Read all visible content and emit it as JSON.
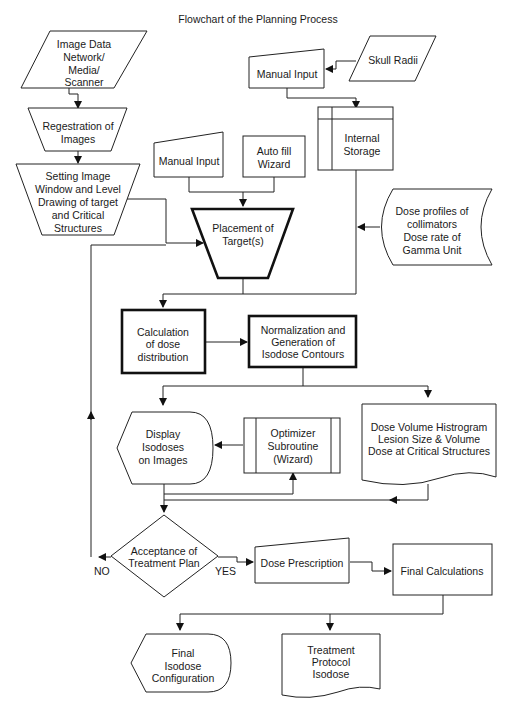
{
  "title": "Flowchart of the Planning Process",
  "nodes": {
    "image_data": {
      "shape": "parallelogram",
      "lines": [
        "Image Data",
        "Network/",
        "Media/",
        "Scanner"
      ]
    },
    "registration": {
      "shape": "trapezoid",
      "lines": [
        "Regestration of",
        "Images"
      ]
    },
    "setting_image": {
      "shape": "trapezoid",
      "lines": [
        "Setting Image",
        "Window and Level",
        "Drawing of target",
        "and Critical",
        "Structures"
      ]
    },
    "manual_input_top": {
      "shape": "manual-input",
      "lines": [
        "Manual Input"
      ]
    },
    "skull_radii": {
      "shape": "parallelogram",
      "lines": [
        "Skull Radii"
      ]
    },
    "internal_storage": {
      "shape": "internal-storage",
      "lines": [
        "Internal",
        "Storage"
      ]
    },
    "manual_input_mid": {
      "shape": "manual-input",
      "lines": [
        "Manual Input"
      ]
    },
    "auto_fill": {
      "shape": "process",
      "lines": [
        "Auto fill",
        "Wizard"
      ]
    },
    "placement": {
      "shape": "manual-operation",
      "lines": [
        "Placement of",
        "Target(s)"
      ]
    },
    "dose_profiles": {
      "shape": "stored-data",
      "lines": [
        "Dose profiles of",
        "collimators",
        "Dose rate of",
        "Gamma Unit"
      ]
    },
    "calculation": {
      "shape": "process-bold",
      "lines": [
        "Calculation",
        "of dose",
        "distribution"
      ]
    },
    "normalization": {
      "shape": "process-bold",
      "lines": [
        "Normalization and",
        "Generation of",
        "Isodose Contours"
      ]
    },
    "display_isodoses": {
      "shape": "display",
      "lines": [
        "Display",
        "Isodoses",
        "on Images"
      ]
    },
    "optimizer": {
      "shape": "predefined-process",
      "lines": [
        "Optimizer",
        "Subroutine",
        "(Wizard)"
      ]
    },
    "dvh": {
      "shape": "document",
      "lines": [
        "Dose Volume Histrogram",
        "Lesion Size & Volume",
        "Dose at Critical Structures"
      ]
    },
    "acceptance": {
      "shape": "decision",
      "lines": [
        "Acceptance of",
        "Treatment Plan"
      ]
    },
    "dose_prescription": {
      "shape": "manual-input",
      "lines": [
        "Dose Prescription"
      ]
    },
    "final_calculations": {
      "shape": "process",
      "lines": [
        "Final Calculations"
      ]
    },
    "final_isodose": {
      "shape": "display",
      "lines": [
        "Final",
        "Isodose",
        "Configuration"
      ]
    },
    "treatment_protocol": {
      "shape": "document",
      "lines": [
        "Treatment",
        "Protocol",
        "Isodose"
      ]
    }
  },
  "edge_labels": {
    "no": "NO",
    "yes": "YES"
  },
  "edges": [
    [
      "image_data",
      "registration"
    ],
    [
      "registration",
      "setting_image"
    ],
    [
      "setting_image",
      "placement"
    ],
    [
      "skull_radii",
      "manual_input_top"
    ],
    [
      "manual_input_top",
      "internal_storage"
    ],
    [
      "manual_input_mid",
      "placement"
    ],
    [
      "auto_fill",
      "placement"
    ],
    [
      "placement",
      "calculation"
    ],
    [
      "internal_storage",
      "calculation"
    ],
    [
      "dose_profiles",
      "internal_storage"
    ],
    [
      "calculation",
      "normalization"
    ],
    [
      "normalization",
      "display_isodoses"
    ],
    [
      "normalization",
      "dvh"
    ],
    [
      "optimizer",
      "display_isodoses"
    ],
    [
      "display_isodoses",
      "optimizer"
    ],
    [
      "display_isodoses",
      "acceptance"
    ],
    [
      "dvh",
      "acceptance"
    ],
    [
      "acceptance",
      "placement",
      "NO"
    ],
    [
      "acceptance",
      "dose_prescription",
      "YES"
    ],
    [
      "dose_prescription",
      "final_calculations"
    ],
    [
      "final_calculations",
      "final_isodose"
    ],
    [
      "final_calculations",
      "treatment_protocol"
    ]
  ]
}
